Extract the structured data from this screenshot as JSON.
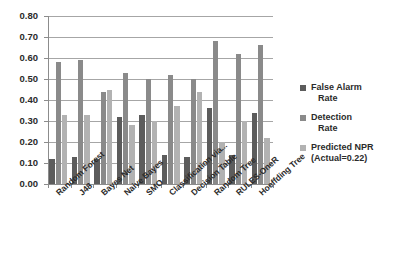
{
  "chart_data": {
    "type": "bar",
    "title": "",
    "xlabel": "",
    "ylabel": "",
    "ylim": [
      0.0,
      0.8
    ],
    "ytick_labels": [
      "0.80",
      "0.70",
      "0.60",
      "0.50",
      "0.40",
      "0.30",
      "0.20",
      "0.10",
      "0.00"
    ],
    "ytick_values": [
      0.8,
      0.7,
      0.6,
      0.5,
      0.4,
      0.3,
      0.2,
      0.1,
      0.0
    ],
    "grid": true,
    "legend_position": "right",
    "categories": [
      "Random Forest",
      "J48",
      "Bayes Net",
      "Naive Bayes",
      "SMO",
      "Classification via...",
      "Decision Table",
      "Random Tree",
      "RULES-OneR",
      "Hoeffding Tree"
    ],
    "series": [
      {
        "name": "False Alarm Rate",
        "color": "#5c5c5c",
        "values": [
          0.12,
          0.13,
          0.12,
          0.32,
          0.33,
          0.14,
          0.13,
          0.36,
          0.14,
          0.34
        ]
      },
      {
        "name": "Detection Rate",
        "color": "#8a8a8a",
        "values": [
          0.58,
          0.59,
          0.44,
          0.53,
          0.5,
          0.52,
          0.5,
          0.68,
          0.62,
          0.66
        ]
      },
      {
        "name": "Predicted NPR",
        "color": "#b2b2b2",
        "values": [
          0.33,
          0.33,
          0.45,
          0.28,
          0.3,
          0.37,
          0.44,
          0.2,
          0.3,
          0.22
        ]
      }
    ]
  },
  "legend": {
    "items": [
      {
        "line1": "False Alarm",
        "line2": "Rate",
        "color": "#5c5c5c"
      },
      {
        "line1": "Detection",
        "line2": "Rate",
        "color": "#8a8a8a"
      },
      {
        "line1": "Predicted NPR",
        "line2": "(Actual=0.22)",
        "color": "#b2b2b2"
      }
    ]
  },
  "axis": {
    "y_min_label": "0.00",
    "y_max_label": "0.80"
  }
}
